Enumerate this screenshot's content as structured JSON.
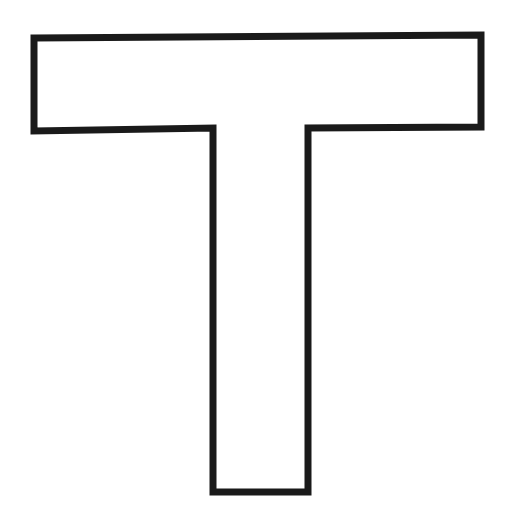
{
  "figure": {
    "letter": "T",
    "stroke_color": "#1a1a1a",
    "fill_color": "#ffffff",
    "background_color": "#ffffff",
    "stroke_width": 7,
    "outline_points": "34,38 481,35 481,127 308,128 308,492 213,492 213,128 34,131"
  }
}
